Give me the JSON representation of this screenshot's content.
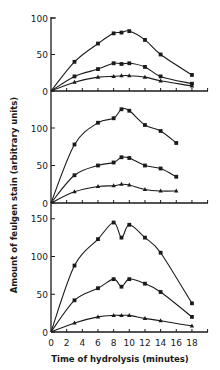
{
  "chart_data": [
    {
      "type": "line",
      "panel": "top",
      "x": [
        0,
        3,
        6,
        8,
        9,
        10,
        12,
        14,
        18
      ],
      "series": [
        {
          "name": "upper (squares)",
          "marker": "square",
          "values": [
            0,
            40,
            65,
            79,
            80,
            82,
            70,
            50,
            22
          ]
        },
        {
          "name": "middle (squares)",
          "marker": "square",
          "values": [
            0,
            20,
            30,
            38,
            37,
            38,
            33,
            20,
            10
          ]
        },
        {
          "name": "lower (triangles)",
          "marker": "triangle",
          "values": [
            0,
            12,
            19,
            20,
            21,
            21,
            19,
            14,
            7
          ]
        }
      ],
      "yticks": [
        0,
        50,
        100
      ],
      "ylim": [
        0,
        100
      ]
    },
    {
      "type": "line",
      "panel": "middle",
      "x": [
        0,
        3,
        6,
        8,
        9,
        10,
        12,
        14,
        16
      ],
      "series": [
        {
          "name": "upper (squares)",
          "marker": "square",
          "values": [
            0,
            78,
            107,
            113,
            125,
            123,
            104,
            96,
            80
          ]
        },
        {
          "name": "middle (squares)",
          "marker": "square",
          "values": [
            0,
            37,
            50,
            54,
            61,
            60,
            50,
            46,
            35
          ]
        },
        {
          "name": "lower (triangles)",
          "marker": "triangle",
          "values": [
            0,
            15,
            22,
            23,
            25,
            24,
            18,
            16,
            16
          ]
        }
      ],
      "yticks": [
        0,
        50,
        100
      ],
      "ylim": [
        0,
        130
      ]
    },
    {
      "type": "line",
      "panel": "bottom",
      "x": [
        0,
        3,
        6,
        8,
        9,
        10,
        12,
        14,
        18
      ],
      "series": [
        {
          "name": "upper (squares)",
          "marker": "square",
          "values": [
            0,
            88,
            123,
            145,
            125,
            142,
            125,
            105,
            38
          ]
        },
        {
          "name": "middle (squares)",
          "marker": "square",
          "values": [
            0,
            42,
            58,
            70,
            60,
            70,
            64,
            53,
            20
          ]
        },
        {
          "name": "lower (triangles)",
          "marker": "triangle",
          "values": [
            0,
            12,
            20,
            22,
            22,
            22,
            18,
            15,
            8
          ]
        }
      ],
      "yticks": [
        0,
        50,
        100,
        150
      ],
      "ylim": [
        0,
        150
      ]
    }
  ],
  "axes": {
    "xlabel": "Time of hydrolysis (minutes)",
    "ylabel": "Amount of feulgen stain (arbitrary units)",
    "xticks": [
      "0",
      "2",
      "4",
      "6",
      "8",
      "10",
      "12",
      "14",
      "16",
      "18"
    ],
    "xlim": [
      0,
      20
    ]
  },
  "panels": {
    "top": {
      "ytick_labels": [
        "0",
        "50",
        "100"
      ]
    },
    "middle": {
      "ytick_labels": [
        "0",
        "50",
        "100"
      ]
    },
    "bottom": {
      "ytick_labels": [
        "0",
        "50",
        "100",
        "150"
      ]
    }
  },
  "colors": {
    "ink": "#1a1a1a",
    "background": "#ffffff"
  }
}
